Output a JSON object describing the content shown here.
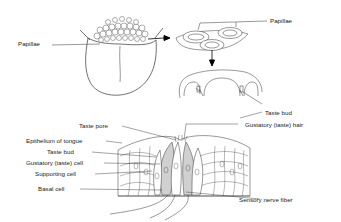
{
  "diagram": {
    "type": "anatomy",
    "panels": [
      {
        "name": "tongue",
        "labels": [
          "Papillae"
        ]
      },
      {
        "name": "papillae-closeup",
        "labels": [
          "Papillae"
        ]
      },
      {
        "name": "papilla-section",
        "labels": [
          "Taste bud"
        ]
      },
      {
        "name": "taste-bud-detail",
        "labels": [
          "Taste pore",
          "Epithelium of tongue",
          "Taste bud",
          "Gustatory (taste) cell",
          "Supporting cell",
          "Basal cell",
          "Gustatory (taste) hair",
          "Sensory nerve fiber"
        ]
      }
    ]
  },
  "labels": {
    "papillae_left": "Papillae",
    "papillae_right": "Papillae",
    "taste_bud_upper": "Taste bud",
    "taste_pore": "Taste pore",
    "epithelium": "Epithelium of tongue",
    "taste_bud_lower": "Taste bud",
    "gustatory_cell": "Gustatory (taste) cell",
    "supporting_cell": "Supporting cell",
    "basal_cell": "Basal cell",
    "gustatory_hair": "Gustatory (taste) hair",
    "sensory_nerve": "Sensory nerve fiber"
  }
}
